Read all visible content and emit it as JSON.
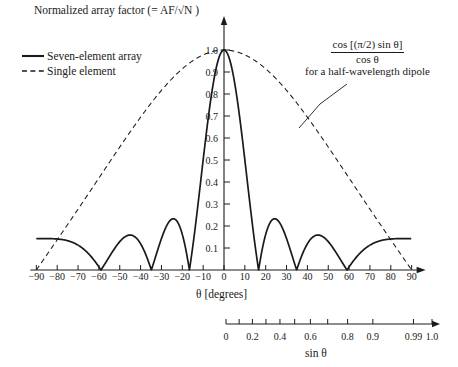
{
  "title": "Normalized array factor (= AF/√N )",
  "legend": {
    "items": [
      {
        "label": "Seven-element array",
        "style": "solid"
      },
      {
        "label": "Single element",
        "style": "dashed"
      }
    ]
  },
  "annotation": {
    "numerator": "cos [(π/2) sin θ]",
    "denominator": "cos θ",
    "subtitle": "for a half-wavelength dipole"
  },
  "axes": {
    "x_label": "θ [degrees]",
    "x_ticks": [
      -90,
      -80,
      -70,
      -60,
      -50,
      -40,
      -30,
      -20,
      -10,
      0,
      10,
      20,
      30,
      40,
      50,
      60,
      70,
      80,
      90
    ],
    "y_ticks": [
      0.1,
      0.2,
      0.3,
      0.4,
      0.5,
      0.6,
      0.7,
      0.8,
      0.9,
      1.0
    ],
    "y_tick_labels": [
      "0.1",
      "0.2",
      "0.3",
      "0.4",
      "0.5",
      "0.6",
      "0.7",
      "0.8",
      "0.9",
      "1.0"
    ],
    "secondary_label": "sin θ",
    "secondary_ticks": [
      {
        "value": 0.0,
        "label": "0"
      },
      {
        "value": 0.1,
        "label": ""
      },
      {
        "value": 0.2,
        "label": "0.2"
      },
      {
        "value": 0.3,
        "label": ""
      },
      {
        "value": 0.4,
        "label": "0.4"
      },
      {
        "value": 0.5,
        "label": ""
      },
      {
        "value": 0.6,
        "label": "0.6"
      },
      {
        "value": 0.7,
        "label": ""
      },
      {
        "value": 0.8,
        "label": "0.8"
      },
      {
        "value": 0.9,
        "label": "0.9"
      },
      {
        "value": 0.99,
        "label": "0.99"
      },
      {
        "value": 1.0,
        "label": "1.0"
      }
    ]
  },
  "chart_data": {
    "type": "line",
    "title": "Normalized array factor (= AF/√N )",
    "xlabel": "θ [degrees]",
    "ylabel": "Normalized array factor",
    "xlim": [
      -90,
      90
    ],
    "ylim": [
      0,
      1.05
    ],
    "grid": false,
    "legend_position": "top-left",
    "series": [
      {
        "name": "Seven-element array",
        "style": "solid",
        "description": "Normalized array factor of a 7-element uniform broadside array, |sin(7u/2)/(7 sin(u/2))| with u = pi*sin(theta)*0.7 approximated; main beam at 0 deg, nulls near +/-15.5, +/-35, +/-60 deg",
        "peak": {
          "theta": 0,
          "value": 1.0
        },
        "nulls_deg": [
          -60,
          -35,
          -15.5,
          15.5,
          35,
          60
        ],
        "sidelobe_peaks": [
          {
            "theta": -90,
            "value": 0.145
          },
          {
            "theta": -76,
            "value": 0.145
          },
          {
            "theta": -45,
            "value": 0.15
          },
          {
            "theta": -24,
            "value": 0.22
          },
          {
            "theta": 24,
            "value": 0.22
          },
          {
            "theta": 45,
            "value": 0.15
          },
          {
            "theta": 76,
            "value": 0.145
          },
          {
            "theta": 90,
            "value": 0.145
          }
        ]
      },
      {
        "name": "Single element",
        "style": "dashed",
        "description": "Element pattern cos[(pi/2) sin theta]/cos theta for a half-wavelength dipole, peak 1.0 at 0 deg falling to 0 at +/-90 deg",
        "peak": {
          "theta": 0,
          "value": 1.0
        },
        "points": [
          {
            "theta": -90,
            "value": 0.0
          },
          {
            "theta": -80,
            "value": 0.12
          },
          {
            "theta": -70,
            "value": 0.26
          },
          {
            "theta": -60,
            "value": 0.4
          },
          {
            "theta": -50,
            "value": 0.53
          },
          {
            "theta": -40,
            "value": 0.66
          },
          {
            "theta": -30,
            "value": 0.77
          },
          {
            "theta": -20,
            "value": 0.88
          },
          {
            "theta": -10,
            "value": 0.96
          },
          {
            "theta": 0,
            "value": 1.0
          },
          {
            "theta": 10,
            "value": 0.96
          },
          {
            "theta": 20,
            "value": 0.88
          },
          {
            "theta": 30,
            "value": 0.77
          },
          {
            "theta": 40,
            "value": 0.66
          },
          {
            "theta": 50,
            "value": 0.53
          },
          {
            "theta": 60,
            "value": 0.4
          },
          {
            "theta": 70,
            "value": 0.26
          },
          {
            "theta": 80,
            "value": 0.12
          },
          {
            "theta": 90,
            "value": 0.0
          }
        ]
      }
    ]
  }
}
